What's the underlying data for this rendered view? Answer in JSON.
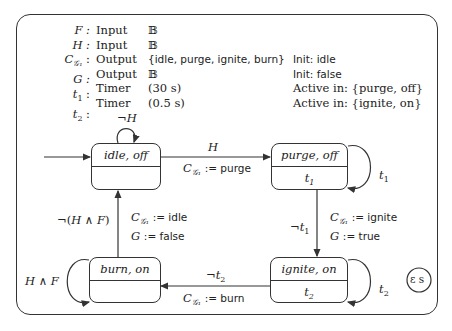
{
  "declarations": [
    {
      "name": "F",
      "kind": "Input",
      "type": "𝔹",
      "note": ""
    },
    {
      "name": "H",
      "kind": "Input",
      "type": "𝔹",
      "note": ""
    },
    {
      "name": "C_G1",
      "kind": "Output",
      "type": "{idle, purge, ignite, burn}",
      "note": "Init: idle"
    },
    {
      "name": "G",
      "kind": "Output",
      "type": "𝔹",
      "note": "Init: false"
    },
    {
      "name": "t1",
      "kind": "Timer",
      "type": "(30 s)",
      "note": "Active in: {purge, off}"
    },
    {
      "name": "t2",
      "kind": "Timer",
      "type": "(0.5 s)",
      "note": "Active in: {ignite, on}"
    }
  ],
  "states": {
    "idle": {
      "label": "idle, off",
      "timer": ""
    },
    "purge": {
      "label": "purge, off",
      "timer": "t1"
    },
    "ignite": {
      "label": "ignite, on",
      "timer": "t2"
    },
    "burn": {
      "label": "burn, on",
      "timer": ""
    }
  },
  "transitions": {
    "idle_self": {
      "guard": "¬H"
    },
    "idle_to_purge": {
      "guard": "H",
      "action": "C_G1 := purge"
    },
    "purge_self": {
      "guard": "t1"
    },
    "purge_to_ignite": {
      "guard": "¬t1",
      "action1": "C_G1 := ignite",
      "action2": "G := true"
    },
    "ignite_self": {
      "guard": "t2"
    },
    "ignite_to_burn": {
      "guard": "¬t2",
      "action": "C_G1 := burn"
    },
    "burn_self": {
      "guard": "H ∧ F"
    },
    "burn_to_idle": {
      "guard": "¬(H ∧ F)",
      "action1": "C_G1 := idle",
      "action2": "G := false"
    }
  },
  "epsilon_badge": "ε s"
}
